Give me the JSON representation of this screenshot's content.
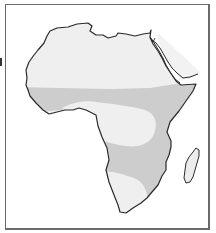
{
  "map": {
    "subject": "Africa",
    "description": "Outline map of Africa with shaded zones",
    "colors": {
      "background": "#ffffff",
      "frame": "#6a6a6a",
      "coastline": "#2a2a2a",
      "light_zone": "#efefef",
      "dark_zone": "#cdcdcd",
      "arabia_fill": "#f2f2f2"
    },
    "zones": [
      {
        "id": "north-zone",
        "shade": "light",
        "region": "North Africa / Sahara"
      },
      {
        "id": "sahel-tropical-band",
        "shade": "dark",
        "region": "Sahel to East Africa band"
      },
      {
        "id": "central-zone",
        "shade": "light",
        "region": "Central Africa / Congo basin"
      },
      {
        "id": "southern-band",
        "shade": "dark",
        "region": "Southern-central band"
      },
      {
        "id": "south-zone",
        "shade": "light",
        "region": "Southwest Africa"
      },
      {
        "id": "madagascar",
        "shade": "light",
        "region": "Madagascar"
      }
    ]
  }
}
